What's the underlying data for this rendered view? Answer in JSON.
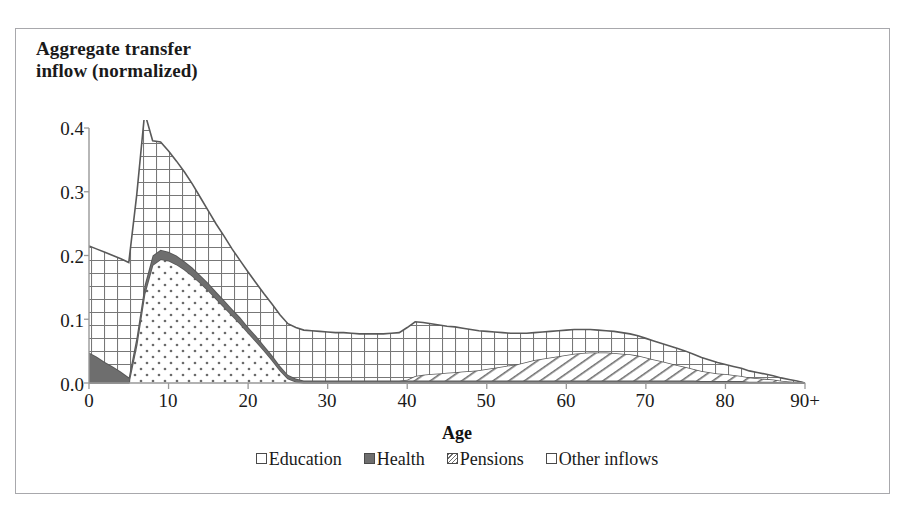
{
  "chart_data": {
    "type": "area",
    "stacked": true,
    "title": "Aggregate transfer\ninflow (normalized)",
    "xlabel": "Age",
    "ylabel": "Aggregate transfer inflow (normalized)",
    "xlim": [
      0,
      90
    ],
    "ylim": [
      0.0,
      0.4
    ],
    "grid": false,
    "legend_position": "bottom",
    "x_tick_labels": [
      "0",
      "10",
      "20",
      "30",
      "40",
      "50",
      "60",
      "70",
      "80",
      "90+"
    ],
    "x_tick_values": [
      0,
      10,
      20,
      30,
      40,
      50,
      60,
      70,
      80,
      90
    ],
    "y_tick_labels": [
      "0.0",
      "0.1",
      "0.2",
      "0.3",
      "0.4"
    ],
    "y_tick_values": [
      0.0,
      0.1,
      0.2,
      0.3,
      0.4
    ],
    "x": [
      0,
      1,
      2,
      3,
      4,
      5,
      6,
      7,
      8,
      9,
      10,
      11,
      12,
      13,
      14,
      15,
      16,
      17,
      18,
      19,
      20,
      21,
      22,
      23,
      24,
      25,
      26,
      27,
      28,
      29,
      30,
      31,
      32,
      33,
      34,
      35,
      36,
      37,
      38,
      39,
      40,
      41,
      42,
      43,
      44,
      45,
      46,
      47,
      48,
      49,
      50,
      51,
      52,
      53,
      54,
      55,
      56,
      57,
      58,
      59,
      60,
      61,
      62,
      63,
      64,
      65,
      66,
      67,
      68,
      69,
      70,
      71,
      72,
      73,
      74,
      75,
      76,
      77,
      78,
      79,
      80,
      81,
      82,
      83,
      84,
      85,
      86,
      87,
      88,
      89,
      90
    ],
    "series": [
      {
        "name": "Education",
        "pattern": "dotted",
        "values": [
          0.0,
          0.0,
          0.0,
          0.0,
          0.0,
          0.0,
          0.06,
          0.14,
          0.185,
          0.194,
          0.192,
          0.186,
          0.178,
          0.168,
          0.157,
          0.145,
          0.132,
          0.119,
          0.106,
          0.093,
          0.079,
          0.065,
          0.051,
          0.036,
          0.02,
          0.007,
          0.002,
          0.0,
          0.0,
          0.0,
          0.0,
          0.0,
          0.0,
          0.0,
          0.0,
          0.0,
          0.0,
          0.0,
          0.0,
          0.0,
          0.0,
          0.0,
          0.0,
          0.0,
          0.0,
          0.0,
          0.0,
          0.0,
          0.0,
          0.0,
          0.0,
          0.0,
          0.0,
          0.0,
          0.0,
          0.0,
          0.0,
          0.0,
          0.0,
          0.0,
          0.0,
          0.0,
          0.0,
          0.0,
          0.0,
          0.0,
          0.0,
          0.0,
          0.0,
          0.0,
          0.0,
          0.0,
          0.0,
          0.0,
          0.0,
          0.0,
          0.0,
          0.0,
          0.0,
          0.0,
          0.0,
          0.0,
          0.0,
          0.0,
          0.0,
          0.0,
          0.0,
          0.0,
          0.0,
          0.0,
          0.0
        ]
      },
      {
        "name": "Health",
        "pattern": "solid-dark",
        "values": [
          0.048,
          0.041,
          0.033,
          0.026,
          0.018,
          0.009,
          0.013,
          0.014,
          0.015,
          0.015,
          0.014,
          0.014,
          0.013,
          0.013,
          0.012,
          0.012,
          0.011,
          0.011,
          0.01,
          0.01,
          0.009,
          0.009,
          0.008,
          0.008,
          0.007,
          0.006,
          0.005,
          0.004,
          0.004,
          0.004,
          0.004,
          0.004,
          0.004,
          0.004,
          0.004,
          0.004,
          0.004,
          0.004,
          0.004,
          0.004,
          0.004,
          0.004,
          0.004,
          0.004,
          0.004,
          0.004,
          0.004,
          0.004,
          0.004,
          0.004,
          0.004,
          0.004,
          0.004,
          0.004,
          0.004,
          0.004,
          0.004,
          0.004,
          0.004,
          0.004,
          0.004,
          0.004,
          0.004,
          0.004,
          0.004,
          0.004,
          0.004,
          0.004,
          0.004,
          0.004,
          0.004,
          0.004,
          0.004,
          0.004,
          0.004,
          0.004,
          0.004,
          0.003,
          0.003,
          0.003,
          0.003,
          0.003,
          0.003,
          0.002,
          0.002,
          0.002,
          0.002,
          0.001,
          0.001,
          0.001,
          0.0
        ]
      },
      {
        "name": "Pensions",
        "pattern": "diagonal-hatch",
        "values": [
          0.0,
          0.0,
          0.0,
          0.0,
          0.0,
          0.0,
          0.0,
          0.0,
          0.0,
          0.0,
          0.0,
          0.0,
          0.0,
          0.0,
          0.0,
          0.0,
          0.0,
          0.0,
          0.0,
          0.0,
          0.0,
          0.0,
          0.0,
          0.0,
          0.0,
          0.0,
          0.0,
          0.0,
          0.0,
          0.0,
          0.0,
          0.0,
          0.0,
          0.0,
          0.0,
          0.0,
          0.0,
          0.0,
          0.0,
          0.0,
          0.001,
          0.007,
          0.009,
          0.01,
          0.011,
          0.012,
          0.013,
          0.014,
          0.015,
          0.016,
          0.018,
          0.02,
          0.022,
          0.024,
          0.026,
          0.029,
          0.032,
          0.034,
          0.036,
          0.038,
          0.04,
          0.042,
          0.043,
          0.044,
          0.044,
          0.044,
          0.043,
          0.042,
          0.041,
          0.039,
          0.036,
          0.033,
          0.03,
          0.027,
          0.024,
          0.021,
          0.018,
          0.016,
          0.014,
          0.012,
          0.011,
          0.0095,
          0.008,
          0.0065,
          0.0055,
          0.0045,
          0.0035,
          0.0025,
          0.0015,
          0.0007,
          0.0
        ]
      },
      {
        "name": "Other inflows",
        "pattern": "grid-crosshatch",
        "values": [
          0.167,
          0.169,
          0.172,
          0.174,
          0.177,
          0.18,
          0.222,
          0.27,
          0.18,
          0.169,
          0.158,
          0.148,
          0.14,
          0.131,
          0.122,
          0.113,
          0.106,
          0.1,
          0.094,
          0.089,
          0.086,
          0.083,
          0.081,
          0.08,
          0.08,
          0.08,
          0.08,
          0.079,
          0.078,
          0.077,
          0.076,
          0.075,
          0.075,
          0.074,
          0.073,
          0.073,
          0.073,
          0.073,
          0.074,
          0.075,
          0.082,
          0.085,
          0.082,
          0.079,
          0.076,
          0.073,
          0.071,
          0.068,
          0.065,
          0.062,
          0.059,
          0.056,
          0.053,
          0.05,
          0.048,
          0.045,
          0.043,
          0.042,
          0.041,
          0.04,
          0.039,
          0.038,
          0.037,
          0.036,
          0.035,
          0.034,
          0.034,
          0.033,
          0.032,
          0.031,
          0.03,
          0.029,
          0.028,
          0.027,
          0.026,
          0.025,
          0.023,
          0.021,
          0.019,
          0.017,
          0.015,
          0.0135,
          0.012,
          0.0105,
          0.009,
          0.0075,
          0.006,
          0.0045,
          0.003,
          0.0015,
          0.0
        ]
      }
    ],
    "totals_note": "Stacked order from bottom: Education, Health, Pensions, Other inflows",
    "colors": {
      "line": "#595959",
      "health_fill": "#707070",
      "axis": "#999999",
      "text": "#1a1a1a"
    }
  },
  "legend": {
    "items": [
      {
        "label": "Education",
        "swatch": "dotted-square-icon"
      },
      {
        "label": "Health",
        "swatch": "filled-square-icon"
      },
      {
        "label": "Pensions",
        "swatch": "hatched-square-icon"
      },
      {
        "label": "Other inflows",
        "swatch": "grid-square-icon"
      }
    ]
  },
  "axes": {
    "x_title": "Age",
    "y_labels": [
      "0.4",
      "0.3",
      "0.2",
      "0.1",
      "0.0"
    ],
    "x_labels": [
      "0",
      "10",
      "20",
      "30",
      "40",
      "50",
      "60",
      "70",
      "80",
      "90+"
    ]
  },
  "title": {
    "line1": "Aggregate transfer",
    "line2": "inflow (normalized)",
    "full": "Aggregate transfer\ninflow (normalized)"
  }
}
